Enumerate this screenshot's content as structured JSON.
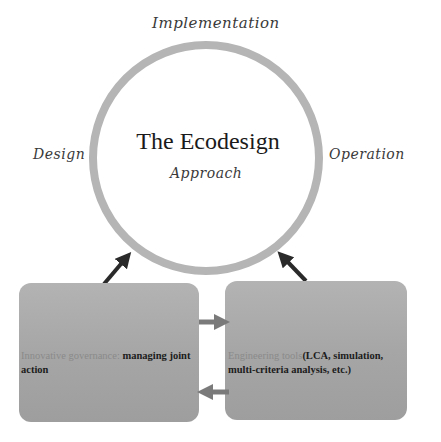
{
  "diagram": {
    "center": {
      "title": "The Ecodesign",
      "subtitle": "Approach"
    },
    "phases": {
      "top": "Implementation",
      "left": "Design",
      "right": "Operation"
    },
    "boxes": [
      {
        "highlight": "Innovative governance:",
        "text": " managing joint action"
      },
      {
        "highlight": "Engineering tools",
        "text": "(LCA, simulation, multi-criteria analysis, etc.)"
      }
    ],
    "colors": {
      "circle_stroke": "#b5b5b5",
      "box_fill": "#a8a8a8",
      "arrow_dark": "#2a2a2a",
      "arrow_gray": "#7a7a7a"
    }
  }
}
